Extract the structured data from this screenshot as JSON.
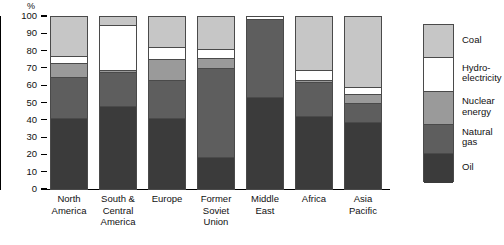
{
  "chart_data": {
    "type": "bar",
    "subtype": "stacked-percentage",
    "title": "",
    "xlabel": "",
    "ylabel": "%",
    "ylim": [
      0,
      100
    ],
    "yticks": [
      0,
      10,
      20,
      30,
      40,
      50,
      60,
      70,
      80,
      90,
      100
    ],
    "grid": false,
    "legend_position": "right",
    "stack_order_bottom_to_top": [
      "Oil",
      "Natural gas",
      "Nuclear energy",
      "Hydro-electricity",
      "Coal"
    ],
    "categories": [
      "North America",
      "South & Central America",
      "Europe",
      "Former Soviet Union",
      "Middle East",
      "Africa",
      "Asia Pacific"
    ],
    "series": [
      {
        "name": "Oil",
        "color": "#3b3b3b",
        "values": [
          41.0,
          48.0,
          41.0,
          18.7,
          53.0,
          42.0,
          39.0
        ]
      },
      {
        "name": "Natural gas",
        "color": "#5e5e5e",
        "values": [
          24.0,
          19.5,
          22.0,
          51.3,
          45.0,
          20.0,
          10.5
        ]
      },
      {
        "name": "Nuclear energy",
        "color": "#9a9a9a",
        "values": [
          8.0,
          1.0,
          12.0,
          6.0,
          0.0,
          1.0,
          5.5
        ]
      },
      {
        "name": "Hydro-electricity",
        "color": "#ffffff",
        "values": [
          4.0,
          26.5,
          7.0,
          5.0,
          2.0,
          6.0,
          4.0
        ]
      },
      {
        "name": "Coal",
        "color": "#c6c6c6",
        "values": [
          23.0,
          5.0,
          18.0,
          19.0,
          0.0,
          31.0,
          41.0
        ]
      }
    ],
    "cumulative_tops": [
      {
        "category": "North America",
        "oil": 41.0,
        "gas": 65.0,
        "nuclear": 73.0,
        "hydro": 77.0,
        "coal": 100
      },
      {
        "category": "South & Central America",
        "oil": 48.0,
        "gas": 67.5,
        "nuclear": 68.5,
        "hydro": 95.0,
        "coal": 100
      },
      {
        "category": "Europe",
        "oil": 41.0,
        "gas": 63.0,
        "nuclear": 75.0,
        "hydro": 82.0,
        "coal": 100
      },
      {
        "category": "Former Soviet Union",
        "oil": 18.7,
        "gas": 70.0,
        "nuclear": 76.0,
        "hydro": 81.0,
        "coal": 100
      },
      {
        "category": "Middle East",
        "oil": 53.0,
        "gas": 98.0,
        "nuclear": 98.0,
        "hydro": 100.0,
        "coal": 100
      },
      {
        "category": "Africa",
        "oil": 42.0,
        "gas": 62.0,
        "nuclear": 63.0,
        "hydro": 69.0,
        "coal": 100
      },
      {
        "category": "Asia Pacific",
        "oil": 39.0,
        "gas": 49.5,
        "nuclear": 55.0,
        "hydro": 59.0,
        "coal": 100
      }
    ]
  },
  "axis": {
    "unit_label": "%",
    "tick_labels": [
      "100",
      "90",
      "80",
      "70",
      "60",
      "50",
      "40",
      "30",
      "20",
      "10",
      "0"
    ]
  },
  "categories": [
    {
      "line1": "North",
      "line2": "America",
      "line3": ""
    },
    {
      "line1": "South &",
      "line2": "Central",
      "line3": "America"
    },
    {
      "line1": "Europe",
      "line2": "",
      "line3": ""
    },
    {
      "line1": "Former",
      "line2": "Soviet",
      "line3": "Union"
    },
    {
      "line1": "Middle",
      "line2": "East",
      "line3": ""
    },
    {
      "line1": "Africa",
      "line2": "",
      "line3": ""
    },
    {
      "line1": "Asia",
      "line2": "Pacific",
      "line3": ""
    }
  ],
  "legend": {
    "items": [
      {
        "line1": "Coal",
        "line2": "",
        "color": "#c6c6c6"
      },
      {
        "line1": "Hydro-",
        "line2": "electricity",
        "color": "#ffffff"
      },
      {
        "line1": "Nuclear",
        "line2": "energy",
        "color": "#9a9a9a"
      },
      {
        "line1": "Natural",
        "line2": "gas",
        "color": "#5e5e5e"
      },
      {
        "line1": "Oil",
        "line2": "",
        "color": "#3b3b3b"
      }
    ]
  }
}
